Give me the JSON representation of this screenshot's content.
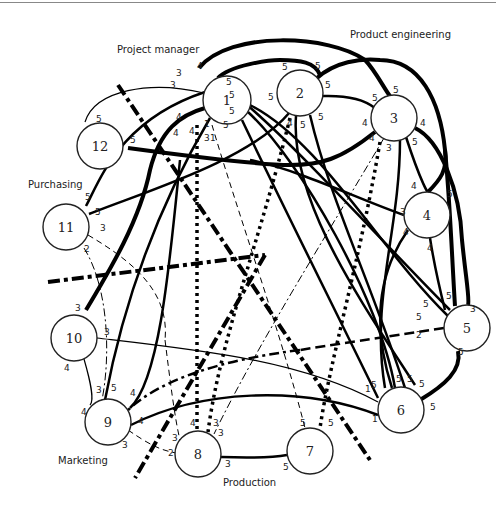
{
  "groups": {
    "project_manager": "Project manager",
    "product_engineering": "Product engineering",
    "purchasing": "Purchasing",
    "marketing": "Marketing",
    "production": "Production"
  },
  "nodes": [
    {
      "id": "1",
      "label": "1",
      "x": 227,
      "y": 100,
      "r": 24
    },
    {
      "id": "2",
      "label": "2",
      "x": 300,
      "y": 93,
      "r": 23
    },
    {
      "id": "3",
      "label": "3",
      "x": 394,
      "y": 118,
      "r": 23
    },
    {
      "id": "4",
      "label": "4",
      "x": 427,
      "y": 215,
      "r": 23
    },
    {
      "id": "5",
      "label": "5",
      "x": 467,
      "y": 328,
      "r": 23
    },
    {
      "id": "6",
      "label": "6",
      "x": 401,
      "y": 410,
      "r": 23
    },
    {
      "id": "7",
      "label": "7",
      "x": 310,
      "y": 451,
      "r": 23
    },
    {
      "id": "8",
      "label": "8",
      "x": 198,
      "y": 454,
      "r": 23
    },
    {
      "id": "9",
      "label": "9",
      "x": 108,
      "y": 422,
      "r": 23
    },
    {
      "id": "10",
      "label": "10",
      "x": 74,
      "y": 338,
      "r": 23
    },
    {
      "id": "11",
      "label": "11",
      "x": 66,
      "y": 227,
      "r": 23
    },
    {
      "id": "12",
      "label": "12",
      "x": 100,
      "y": 146,
      "r": 23
    }
  ],
  "edge_labels": [
    {
      "text": "4",
      "x": 197,
      "y": 69
    },
    {
      "text": "3",
      "x": 176,
      "y": 76
    },
    {
      "text": "3",
      "x": 170,
      "y": 88
    },
    {
      "text": "5",
      "x": 226,
      "y": 85
    },
    {
      "text": "5",
      "x": 229,
      "y": 98
    },
    {
      "text": "5",
      "x": 229,
      "y": 114
    },
    {
      "text": "5",
      "x": 223,
      "y": 128
    },
    {
      "text": "4",
      "x": 176,
      "y": 120
    },
    {
      "text": "4",
      "x": 173,
      "y": 136
    },
    {
      "text": "4",
      "x": 189,
      "y": 134
    },
    {
      "text": "1",
      "x": 204,
      "y": 127
    },
    {
      "text": "3",
      "x": 204,
      "y": 141
    },
    {
      "text": "1",
      "x": 210,
      "y": 141
    },
    {
      "text": "5",
      "x": 282,
      "y": 70
    },
    {
      "text": "5",
      "x": 315,
      "y": 69
    },
    {
      "text": "5",
      "x": 268,
      "y": 100
    },
    {
      "text": "5",
      "x": 325,
      "y": 88
    },
    {
      "text": "5",
      "x": 318,
      "y": 120
    },
    {
      "text": "4",
      "x": 287,
      "y": 126
    },
    {
      "text": "5",
      "x": 300,
      "y": 128
    },
    {
      "text": "5",
      "x": 393,
      "y": 93
    },
    {
      "text": "5",
      "x": 372,
      "y": 101
    },
    {
      "text": "4",
      "x": 362,
      "y": 126
    },
    {
      "text": "4",
      "x": 420,
      "y": 126
    },
    {
      "text": "4",
      "x": 369,
      "y": 141
    },
    {
      "text": "3",
      "x": 386,
      "y": 151
    },
    {
      "text": "5",
      "x": 412,
      "y": 145
    },
    {
      "text": "4",
      "x": 411,
      "y": 189
    },
    {
      "text": "5",
      "x": 447,
      "y": 197
    },
    {
      "text": "3",
      "x": 400,
      "y": 215
    },
    {
      "text": "4",
      "x": 403,
      "y": 235
    },
    {
      "text": "4",
      "x": 427,
      "y": 251
    },
    {
      "text": "5",
      "x": 446,
      "y": 299
    },
    {
      "text": "5",
      "x": 423,
      "y": 307
    },
    {
      "text": "3",
      "x": 470,
      "y": 312
    },
    {
      "text": "5",
      "x": 416,
      "y": 320
    },
    {
      "text": "2",
      "x": 416,
      "y": 338
    },
    {
      "text": "5",
      "x": 458,
      "y": 355
    },
    {
      "text": "1",
      "x": 365,
      "y": 392
    },
    {
      "text": "5",
      "x": 371,
      "y": 388
    },
    {
      "text": "5",
      "x": 396,
      "y": 382
    },
    {
      "text": "5",
      "x": 407,
      "y": 382
    },
    {
      "text": "5",
      "x": 419,
      "y": 387
    },
    {
      "text": "5",
      "x": 430,
      "y": 410
    },
    {
      "text": "1",
      "x": 372,
      "y": 422
    },
    {
      "text": "5",
      "x": 300,
      "y": 426
    },
    {
      "text": "5",
      "x": 328,
      "y": 426
    },
    {
      "text": "5",
      "x": 283,
      "y": 470
    },
    {
      "text": "3",
      "x": 225,
      "y": 467
    },
    {
      "text": "4",
      "x": 190,
      "y": 426
    },
    {
      "text": "3",
      "x": 213,
      "y": 426
    },
    {
      "text": "3",
      "x": 218,
      "y": 436
    },
    {
      "text": "3",
      "x": 172,
      "y": 441
    },
    {
      "text": "2",
      "x": 168,
      "y": 456
    },
    {
      "text": "3",
      "x": 96,
      "y": 393
    },
    {
      "text": "5",
      "x": 111,
      "y": 391
    },
    {
      "text": "4",
      "x": 130,
      "y": 396
    },
    {
      "text": "4",
      "x": 81,
      "y": 415
    },
    {
      "text": "4",
      "x": 138,
      "y": 424
    },
    {
      "text": "3",
      "x": 122,
      "y": 448
    },
    {
      "text": "4",
      "x": 64,
      "y": 371
    },
    {
      "text": "3",
      "x": 75,
      "y": 311
    },
    {
      "text": "3",
      "x": 104,
      "y": 335
    },
    {
      "text": "5",
      "x": 85,
      "y": 200
    },
    {
      "text": "5",
      "x": 95,
      "y": 215
    },
    {
      "text": "3",
      "x": 100,
      "y": 231
    },
    {
      "text": "2",
      "x": 84,
      "y": 252
    },
    {
      "text": "5",
      "x": 96,
      "y": 122
    },
    {
      "text": "5",
      "x": 130,
      "y": 143
    }
  ]
}
